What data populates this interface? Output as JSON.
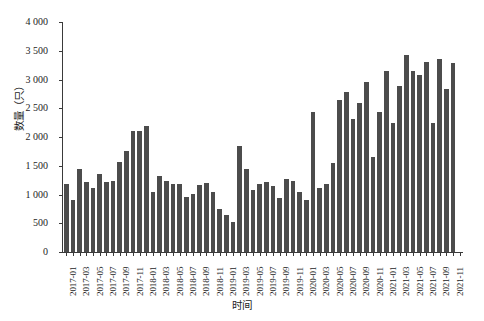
{
  "chart_data": {
    "type": "bar",
    "title": "",
    "xlabel": "时间",
    "ylabel": "数量（只）",
    "ylim": [
      0,
      4000
    ],
    "ytick_values": [
      0,
      500,
      1000,
      1500,
      2000,
      2500,
      3000,
      3500,
      4000
    ],
    "ytick_labels": [
      "0",
      "500",
      "1 000",
      "1 500",
      "2 000",
      "2 500",
      "3 000",
      "3 500",
      "4 000"
    ],
    "grid": false,
    "legend": null,
    "bar_color": "#4c4c4c",
    "axis_color": "#3a3a3a",
    "xtick_labels_every": 2,
    "categories": [
      "2017-01",
      "2017-02",
      "2017-03",
      "2017-04",
      "2017-05",
      "2017-06",
      "2017-07",
      "2017-08",
      "2017-09",
      "2017-10",
      "2017-11",
      "2017-12",
      "2018-01",
      "2018-02",
      "2018-03",
      "2018-04",
      "2018-05",
      "2018-06",
      "2018-07",
      "2018-08",
      "2018-09",
      "2018-10",
      "2018-11",
      "2018-12",
      "2019-01",
      "2019-02",
      "2019-03",
      "2019-04",
      "2019-05",
      "2019-06",
      "2019-07",
      "2019-08",
      "2019-09",
      "2019-10",
      "2019-11",
      "2019-12",
      "2020-01",
      "2020-02",
      "2020-03",
      "2020-04",
      "2020-05",
      "2020-06",
      "2020-07",
      "2020-08",
      "2020-09",
      "2020-10",
      "2020-11",
      "2020-12",
      "2021-01",
      "2021-02",
      "2021-03",
      "2021-04",
      "2021-05",
      "2021-06",
      "2021-07",
      "2021-08",
      "2021-09",
      "2021-10",
      "2021-11",
      "2021-12"
    ],
    "values": [
      1180,
      900,
      1450,
      1210,
      1120,
      1350,
      1220,
      1230,
      1560,
      1760,
      2100,
      2110,
      2190,
      1050,
      1330,
      1240,
      1180,
      1180,
      960,
      1010,
      1160,
      1200,
      1050,
      740,
      650,
      530,
      1850,
      1450,
      1080,
      1190,
      1210,
      1150,
      940,
      1270,
      1230,
      1050,
      900,
      2440,
      1110,
      1180,
      1540,
      2640,
      2790,
      2310,
      2600,
      2960,
      1660,
      2440,
      3150,
      2240,
      2880,
      3430,
      3150,
      3070,
      3310,
      2240,
      3360,
      2830,
      3280,
      0
    ],
    "x_tick_label_list": [
      "2017-01",
      "2017-03",
      "2017-05",
      "2017-07",
      "2017-09",
      "2017-11",
      "2018-01",
      "2018-03",
      "2018-05",
      "2018-07",
      "2018-09",
      "2018-11",
      "2019-01",
      "2019-03",
      "2019-05",
      "2019-07",
      "2019-09",
      "2019-11",
      "2020-01",
      "2020-03",
      "2020-05",
      "2020-07",
      "2020-09",
      "2020-11",
      "2021-01",
      "2021-03",
      "2021-05",
      "2021-07",
      "2021-09",
      "2021-11"
    ]
  },
  "caption": ""
}
